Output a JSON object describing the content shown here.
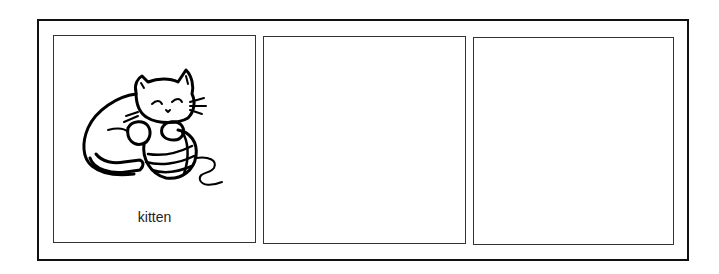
{
  "worksheet": {
    "cards": [
      {
        "label": "kitten",
        "image": "kitten-playing-with-yarn-icon"
      },
      {
        "label": "",
        "image": ""
      },
      {
        "label": "",
        "image": ""
      }
    ]
  }
}
